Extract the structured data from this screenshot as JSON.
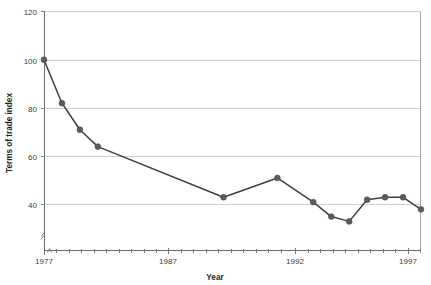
{
  "chart_title": "",
  "chart_data": {
    "type": "line",
    "title": "",
    "xlabel": "Year",
    "ylabel": "Terms of trade index",
    "x": [
      1977,
      1978,
      1979,
      1980,
      1981,
      1987,
      1990,
      1992,
      1993,
      1994,
      1995,
      1996,
      1997,
      1998
    ],
    "values": [
      100,
      82,
      71,
      64,
      64,
      43,
      51,
      41,
      35,
      33,
      42,
      43,
      43,
      38
    ],
    "series": [
      {
        "name": "Terms of trade index",
        "points": [
          {
            "x": 1977,
            "y": 100
          },
          {
            "x": 1978,
            "y": 82
          },
          {
            "x": 1979,
            "y": 71
          },
          {
            "x": 1980,
            "y": 64
          },
          {
            "x": 1987,
            "y": 43
          },
          {
            "x": 1990,
            "y": 51
          },
          {
            "x": 1992,
            "y": 41
          },
          {
            "x": 1993,
            "y": 35
          },
          {
            "x": 1994,
            "y": 33
          },
          {
            "x": 1995,
            "y": 42
          },
          {
            "x": 1996,
            "y": 43
          },
          {
            "x": 1997,
            "y": 43
          },
          {
            "x": 1998,
            "y": 38
          }
        ]
      }
    ],
    "ylim": [
      28,
      120
    ],
    "xlim": [
      1977,
      1998
    ],
    "y_ticks": [
      40,
      60,
      80,
      100,
      120
    ],
    "y_tick_labels": [
      "40",
      "60",
      "80",
      "100",
      "120"
    ],
    "x_ticks": [
      1977,
      1987,
      1992,
      1997
    ],
    "x_tick_labels": [
      "1977",
      "1987",
      "1992",
      "1997"
    ],
    "x_minor_tick_years": [
      1978,
      1979,
      1980,
      1981,
      1982,
      1983,
      1984,
      1985,
      1986,
      1988,
      1989,
      1990,
      1991,
      1993,
      1994,
      1995,
      1996,
      1998
    ],
    "grid": true,
    "grid_axis": "y",
    "legend": false,
    "legend_position": "none",
    "y_axis_break": true,
    "marker": "circle",
    "line_color": "#3f3f41",
    "marker_color": "#5b5b5e",
    "grid_color": "#b9b9bb",
    "axis_color": "#6d6c70"
  },
  "y_tick_labels": {
    "t120": "120",
    "t100": "100",
    "t80": "80",
    "t60": "60",
    "t40": "40"
  },
  "x_tick_labels": {
    "t1977": "1977",
    "t1987": "1987",
    "t1992": "1992",
    "t1997": "1997"
  },
  "axis_titles": {
    "x": "Year",
    "y": "Terms of trade index"
  }
}
